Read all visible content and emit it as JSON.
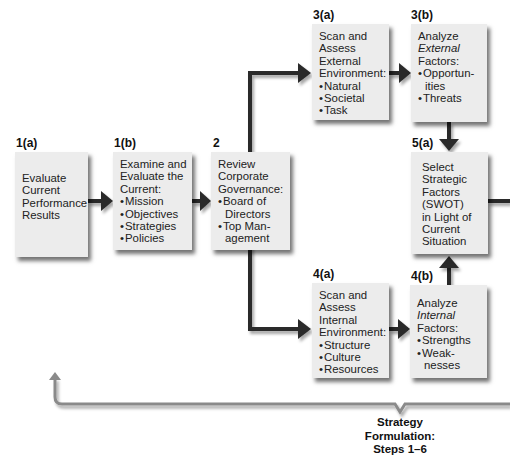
{
  "steps": {
    "s1a": {
      "label": "1(a)",
      "lines": [
        "Evaluate",
        "Current",
        "Performance",
        "Results"
      ]
    },
    "s1b": {
      "label": "1(b)",
      "lines": [
        "Examine and",
        "Evaluate the",
        "Current:"
      ],
      "bullets": [
        "Mission",
        "Objectives",
        "Strategies",
        "Policies"
      ]
    },
    "s2": {
      "label": "2",
      "lines": [
        "Review",
        "Corporate",
        "Governance:"
      ],
      "bullets": [
        "Board of",
        "Directors",
        "Top Man-",
        "agement"
      ]
    },
    "s3a": {
      "label": "3(a)",
      "lines": [
        "Scan and",
        "Assess",
        "External",
        "Environment:"
      ],
      "bullets": [
        "Natural",
        "Societal",
        "Task"
      ]
    },
    "s3b": {
      "label": "3(b)",
      "lines": [
        "Analyze",
        "External",
        "Factors:"
      ],
      "bullets": [
        "Opportun-",
        "ities",
        "Threats"
      ]
    },
    "s4a": {
      "label": "4(a)",
      "lines": [
        "Scan and",
        "Assess",
        "Internal",
        "Environment:"
      ],
      "bullets": [
        "Structure",
        "Culture",
        "Resources"
      ]
    },
    "s4b": {
      "label": "4(b)",
      "lines": [
        "Analyze",
        "Internal",
        "Factors:"
      ],
      "bullets": [
        "Strengths",
        "Weak-",
        "nesses"
      ]
    },
    "s5a": {
      "label": "5(a)",
      "lines": [
        "Select",
        "Strategic",
        "Factors",
        "(SWOT)",
        "in Light of",
        "Current",
        "Situation"
      ]
    }
  },
  "caption": {
    "line1": "Strategy",
    "line2": "Formulation:",
    "line3": "Steps 1–6"
  },
  "colors": {
    "box_fill": "#ececec",
    "connector": "#2a2a2a",
    "bracket": "#8a8a8a"
  }
}
